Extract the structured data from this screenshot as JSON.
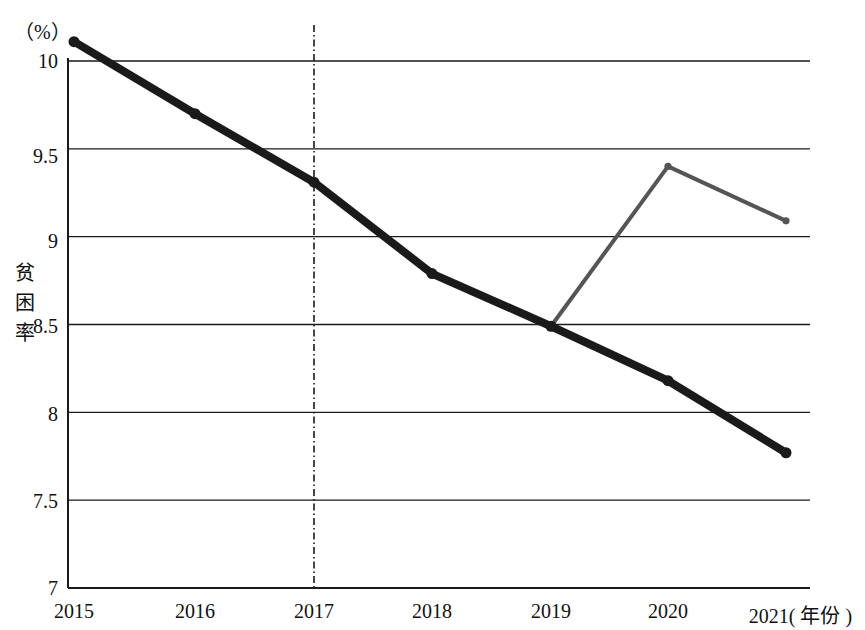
{
  "chart_data": {
    "type": "line",
    "title": "",
    "subtitle": "",
    "unit_label": "（%）",
    "ylabel": "贫困率",
    "xlabel": "(年份)",
    "xlabel_full": "2021( 年份 )",
    "categories": [
      "2015",
      "2016",
      "2017",
      "2018",
      "2019",
      "2020",
      "2021"
    ],
    "x_tick_labels": [
      "2015",
      "2016",
      "2017",
      "2018",
      "2019",
      "2020",
      "2021( 年份 )"
    ],
    "y_tick_labels": [
      "10",
      "9.5",
      "9",
      "8.5",
      "8",
      "7.5",
      "7"
    ],
    "y_ticks": [
      10,
      9.5,
      9,
      8.5,
      8,
      7.5,
      7
    ],
    "ylim": [
      7,
      10.25
    ],
    "xlim": [
      "2015",
      "2021"
    ],
    "grid": "horizontal",
    "legend": "none",
    "legend_position": "none",
    "series": [
      {
        "name": "actual",
        "color": "#1a1a1a",
        "style": "solid-thick",
        "x": [
          "2015",
          "2016",
          "2017",
          "2018",
          "2019",
          "2020",
          "2021"
        ],
        "values": [
          10.11,
          9.7,
          9.31,
          8.79,
          8.49,
          8.18,
          7.77
        ]
      },
      {
        "name": "counterfactual",
        "color": "#555555",
        "style": "solid-thin",
        "x": [
          "2019",
          "2020",
          "2021"
        ],
        "values": [
          8.49,
          9.4,
          9.09
        ]
      }
    ],
    "annotations": [
      {
        "type": "vertical-dash-dot-line",
        "x": "2017",
        "label": ""
      }
    ]
  },
  "axis": {
    "unit": "（%）",
    "y_title": "贫困率",
    "y_title_chars": [
      "贫",
      "困",
      "率"
    ]
  },
  "colors": {
    "primary_line": "#1a1a1a",
    "secondary_line": "#555555",
    "grid": "#1a1a1a",
    "background": "#ffffff",
    "text": "#111111"
  }
}
